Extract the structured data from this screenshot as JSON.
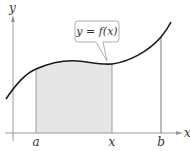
{
  "diagram": {
    "curve_label": "y = f(x)",
    "axes": {
      "x_label": "x",
      "y_label": "y"
    },
    "points": [
      {
        "name": "a",
        "label": "a"
      },
      {
        "name": "x",
        "label": "x"
      },
      {
        "name": "b",
        "label": "b"
      }
    ],
    "colors": {
      "curve": "#1a1a1a",
      "axis": "#9a9a9a",
      "shade": "#e6e6e6",
      "callout_border": "#9a9a9a"
    }
  }
}
